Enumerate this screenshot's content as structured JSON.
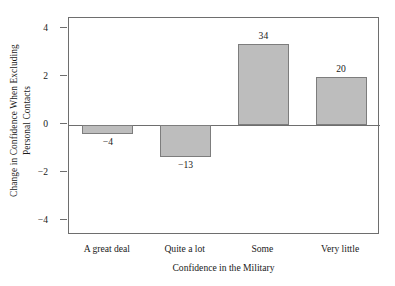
{
  "chart_data": {
    "type": "bar",
    "title": "",
    "subtitle": "",
    "xlabel": "Confidence in the Military",
    "ylabel": "Change in Confidence When Excluding Personal Contacts",
    "ylabel_line1": "Change in Confidence When Excluding",
    "ylabel_line2": "Personal Contacts",
    "categories": [
      "A great deal",
      "Quite a lot",
      "Some",
      "Very little"
    ],
    "values": [
      -4,
      -13,
      34,
      20
    ],
    "data_labels": [
      "−4",
      "−13",
      "34",
      "20"
    ],
    "bar_heights_axis_units": [
      -0.37,
      -1.33,
      3.38,
      1.98
    ],
    "ylim": [
      -4.6,
      4.45
    ],
    "yticks": [
      4,
      2,
      0,
      -2,
      -4
    ],
    "ytick_labels": [
      "4",
      "2",
      "0",
      "−2",
      "−4"
    ],
    "grid": false,
    "legend": null,
    "bar_color": "#bdbdbd",
    "bar_edge_color": "#7d7d7d",
    "axis_color": "#6e6e6e",
    "background": "#ffffff"
  }
}
